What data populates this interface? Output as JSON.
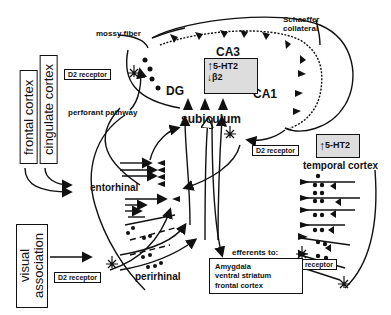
{
  "regions": {
    "ca3": "CA3",
    "ca1": "CA1",
    "dg": "DG",
    "subiculum": "subiculum",
    "entorhinal": "entorhinal",
    "perirhinal": "perirhinal",
    "temporal_cortex": "temporal cortex"
  },
  "pathways": {
    "mossy_fiber": "mossy fiber",
    "schaffer_collateral_1": "Schaeffer",
    "schaffer_collateral_2": "collateral",
    "perforant_pathway": "perforant pathway"
  },
  "input_boxes": {
    "frontal_cortex": "frontal cortex",
    "cingulate_cortex": "cingulate cortex",
    "visual_association_1": "visual",
    "visual_association_2": "association"
  },
  "receptors": {
    "d2_dg": "D2 receptor",
    "d2_subiculum": "D2 receptor",
    "d2_perirhinal": "D2 receptor",
    "d2_temporal": "D2 receptor",
    "ht_hippocampus_line1": "5-HT2",
    "ht_hippocampus_line2": "β2",
    "ht_temporal": "5-HT2"
  },
  "efferents": {
    "heading": "efferents to:",
    "targets": [
      "Amygdala",
      "ventral striatum",
      "frontal cortex"
    ]
  },
  "colors": {
    "ink": "#111111",
    "background": "#ffffff",
    "receptor_box_fill": "#dddddd"
  }
}
